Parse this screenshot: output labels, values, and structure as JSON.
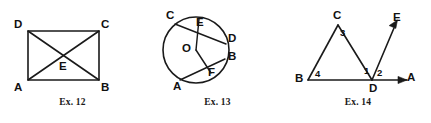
{
  "sheet": {
    "background_color": "#ffffff",
    "ink_color": "#1a1a1a",
    "width": 431,
    "height": 123
  },
  "figures": [
    {
      "id": "ex12",
      "caption": "Ex. 12",
      "caption_top": 98,
      "shape": "rectangle-with-diagonals",
      "labels": [
        {
          "name": "vertex-label-d",
          "text": "D",
          "left": 14,
          "top": 19
        },
        {
          "name": "vertex-label-c",
          "text": "C",
          "left": 101,
          "top": 19
        },
        {
          "name": "vertex-label-a",
          "text": "A",
          "left": 14,
          "top": 82
        },
        {
          "name": "vertex-label-b",
          "text": "B",
          "left": 101,
          "top": 82
        },
        {
          "name": "vertex-label-e",
          "text": "E",
          "left": 59,
          "top": 61
        }
      ],
      "geometry": {
        "corner_d": [
          28,
          31
        ],
        "corner_c": [
          99,
          31
        ],
        "corner_a": [
          28,
          80
        ],
        "corner_b": [
          99,
          80
        ],
        "intersection_e": [
          63.5,
          55.5
        ]
      }
    },
    {
      "id": "ex13",
      "caption": "Ex. 13",
      "caption_top": 98,
      "shape": "circle-with-chords-and-radii",
      "labels": [
        {
          "name": "vertex-label-c",
          "text": "C",
          "left": 21,
          "top": 10
        },
        {
          "name": "vertex-label-e",
          "text": "E",
          "left": 51,
          "top": 17
        },
        {
          "name": "vertex-label-d",
          "text": "D",
          "left": 83,
          "top": 33
        },
        {
          "name": "vertex-label-b",
          "text": "B",
          "left": 83,
          "top": 51
        },
        {
          "name": "vertex-label-o",
          "text": "O",
          "left": 37,
          "top": 43
        },
        {
          "name": "vertex-label-f",
          "text": "F",
          "left": 63,
          "top": 67
        },
        {
          "name": "vertex-label-a",
          "text": "A",
          "left": 28,
          "top": 81
        }
      ],
      "geometry": {
        "center_o": [
          51,
          50
        ],
        "radius": 33,
        "point_c": [
          30,
          24
        ],
        "point_e": [
          54,
          19
        ],
        "point_d": [
          81,
          44
        ],
        "point_b": [
          80,
          59
        ],
        "point_f": [
          66,
          73
        ],
        "point_a": [
          35,
          80
        ]
      }
    },
    {
      "id": "ex14",
      "caption": "Ex. 14",
      "caption_top": 98,
      "shape": "triangle-with-rays",
      "labels": [
        {
          "name": "vertex-label-c",
          "text": "C",
          "left": 48,
          "top": 10
        },
        {
          "name": "vertex-label-e",
          "text": "E",
          "left": 108,
          "top": 12
        },
        {
          "name": "vertex-label-b",
          "text": "B",
          "left": 10,
          "top": 73
        },
        {
          "name": "vertex-label-d",
          "text": "D",
          "left": 84,
          "top": 83
        },
        {
          "name": "vertex-label-a",
          "text": "A",
          "left": 122,
          "top": 72
        }
      ],
      "angle_labels": [
        {
          "name": "angle-label-1",
          "text": "1",
          "left": 79,
          "top": 66
        },
        {
          "name": "angle-label-2",
          "text": "2",
          "left": 92,
          "top": 68
        },
        {
          "name": "angle-label-3",
          "text": "3",
          "left": 55,
          "top": 28
        },
        {
          "name": "angle-label-4",
          "text": "4",
          "left": 30,
          "top": 69
        }
      ],
      "geometry": {
        "point_b": [
          23,
          80
        ],
        "point_c": [
          53,
          25
        ],
        "point_d": [
          87,
          80
        ],
        "ray_a_tip": [
          130,
          80
        ],
        "ray_e_tip": [
          114,
          23
        ]
      }
    }
  ]
}
